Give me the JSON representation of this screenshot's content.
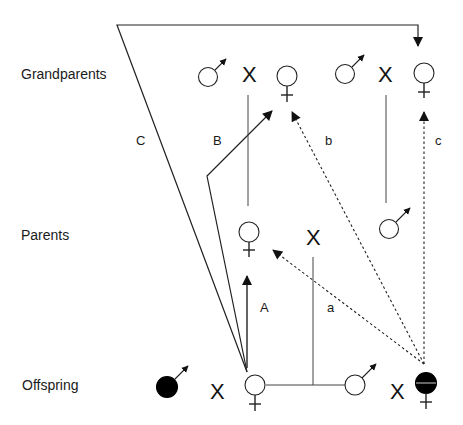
{
  "rows": {
    "grandparents": "Grandparents",
    "parents": "Parents",
    "offspring": "Offspring"
  },
  "cross_symbol": "X",
  "path_labels": {
    "A": "A",
    "B": "B",
    "C": "C",
    "a": "a",
    "b": "b",
    "c": "c"
  },
  "nodes": {
    "grandparents": [
      {
        "sex": "male",
        "filled": false
      },
      {
        "sex": "female",
        "filled": false
      },
      {
        "sex": "male",
        "filled": false
      },
      {
        "sex": "female",
        "filled": false
      }
    ],
    "parents": [
      {
        "sex": "female",
        "filled": false
      },
      {
        "sex": "male",
        "filled": false
      }
    ],
    "offspring": [
      {
        "sex": "male",
        "filled": true
      },
      {
        "sex": "female",
        "filled": false
      },
      {
        "sex": "male",
        "filled": false
      },
      {
        "sex": "female",
        "filled": "half"
      }
    ]
  },
  "edges": {
    "solid_arrows": [
      "A: offspring female -> parent female",
      "B: offspring female -> grandmother (paternal side)",
      "C: offspring female -> grandmother (right)"
    ],
    "dashed_arrows": [
      "a: offspring female (right) -> parent female",
      "b: offspring female (right) -> grandmother (left)",
      "c: offspring female (right) -> grandmother (right)"
    ]
  },
  "colors": {
    "line": "#222222",
    "fill": "#000000",
    "background": "#ffffff"
  }
}
